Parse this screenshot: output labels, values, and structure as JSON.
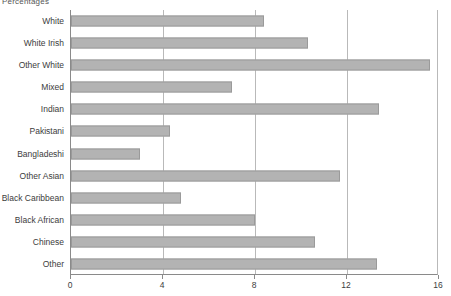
{
  "chart_data": {
    "type": "bar",
    "orientation": "horizontal",
    "title": "Percentages",
    "xlabel": "",
    "ylabel": "",
    "xlim": [
      0,
      16
    ],
    "xticks": [
      0,
      4,
      8,
      12,
      16
    ],
    "grid": true,
    "legend": "none",
    "bar_color": "#b3b3b3",
    "bar_edge_color": "#9a9a9a",
    "axis_color": "#8a8a8a",
    "gridline_color": "#b9b9b9",
    "categories": [
      "White",
      "White Irish",
      "Other White",
      "Mixed",
      "Indian",
      "Pakistani",
      "Bangladeshi",
      "Other Asian",
      "Black Caribbean",
      "Black African",
      "Chinese",
      "Other"
    ],
    "values": [
      8.4,
      10.3,
      15.6,
      7.0,
      13.4,
      4.3,
      3.0,
      11.7,
      4.8,
      8.0,
      10.6,
      13.3
    ]
  }
}
